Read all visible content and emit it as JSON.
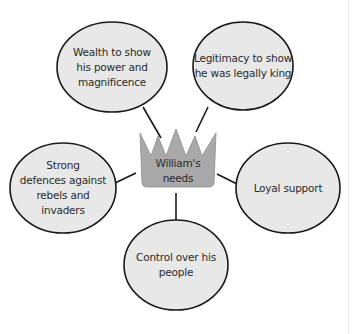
{
  "diagram": {
    "type": "spider-diagram",
    "colors": {
      "background": "#ffffff",
      "ellipse_fill": "#e8e8e8",
      "crown_fill": "#a9a9a9",
      "outline": "#1a1a1a",
      "text": "#2a2a2a"
    },
    "center": {
      "shape": "crown",
      "label": "William's\nneeds"
    },
    "nodes": [
      {
        "id": "wealth",
        "label": "Wealth to show\nhis power and\nmagnificence"
      },
      {
        "id": "legitimacy",
        "label": "Legitimacy to show\nhe was legally king"
      },
      {
        "id": "defences",
        "label": "Strong\ndefences against\nrebels and\ninvaders"
      },
      {
        "id": "loyal",
        "label": "Loyal support"
      },
      {
        "id": "control",
        "label": "Control over his\npeople"
      }
    ]
  }
}
